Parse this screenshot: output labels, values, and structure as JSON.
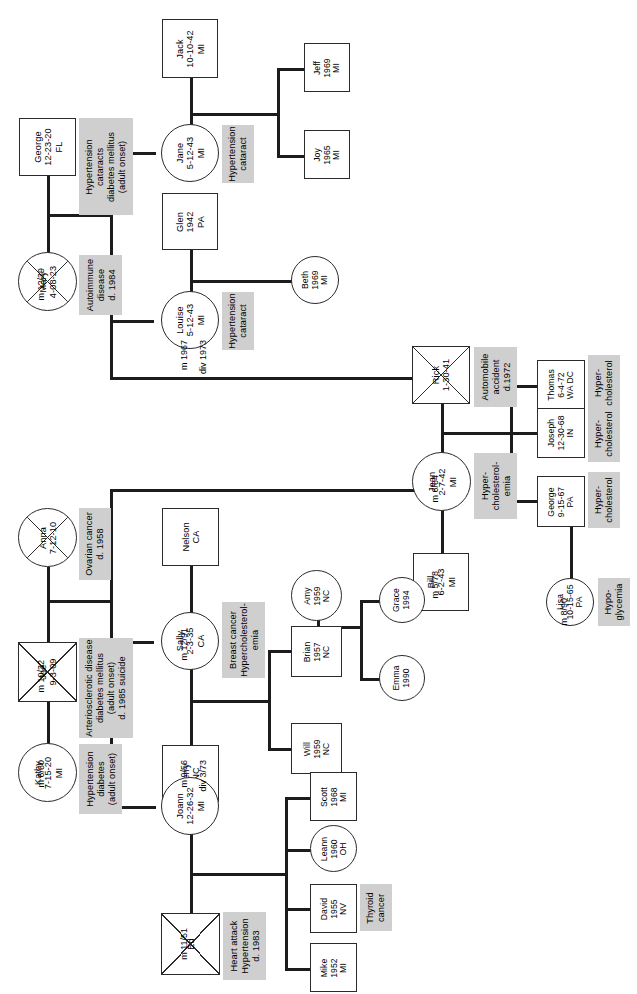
{
  "document": {
    "type": "family-pedigree-health-history-chart",
    "orientation": "rotated-90-counterclockwise",
    "symbol_legend": {
      "square": "male",
      "circle": "female",
      "diagonal-cross": "deceased",
      "grey-box": "medical condition annotation",
      "m": "married",
      "div": "divorced"
    },
    "colors": {
      "node_fill": "#ffffff",
      "node_stroke": "#2b2b2b",
      "annotation_fill": "#cfcfcf",
      "line": "#1c1c1c",
      "background": "#ffffff"
    }
  },
  "people": {
    "george_sr": {
      "name": "George",
      "dob": "12-23-20",
      "state": "FL",
      "sex": "male",
      "deceased": false,
      "text": "George\n12-23-20\nFL"
    },
    "mary": {
      "name": "Mary",
      "dob": "4-08-23",
      "state": "",
      "sex": "female",
      "deceased": true,
      "text": "Mary\n4-08-23"
    },
    "jack": {
      "name": "Jack",
      "dob": "10-10-42",
      "state": "MI",
      "sex": "male",
      "deceased": false,
      "text": "Jack\n10-10-42\nMI"
    },
    "jane": {
      "name": "Jane",
      "dob": "5-12-43",
      "state": "MI",
      "sex": "female",
      "deceased": false,
      "text": "Jane\n5-12-43\nMI"
    },
    "jeff": {
      "name": "Jeff",
      "dob": "1969",
      "state": "MI",
      "sex": "male",
      "deceased": false,
      "text": "Jeff\n1969\nMI"
    },
    "joy": {
      "name": "Joy",
      "dob": "1965",
      "state": "MI",
      "sex": "male",
      "deceased": false,
      "text": "Joy\n1965\nMI"
    },
    "glen": {
      "name": "Glen",
      "dob": "1942",
      "state": "PA",
      "sex": "male",
      "deceased": false,
      "text": "Glen\n1942\nPA"
    },
    "louise": {
      "name": "Louise",
      "dob": "5-12-43",
      "state": "MI",
      "sex": "female",
      "deceased": false,
      "text": "Louise\n5-12-43\nMI"
    },
    "beth": {
      "name": "Beth",
      "dob": "1969",
      "state": "MI",
      "sex": "female",
      "deceased": false,
      "text": "Beth\n1969\nMI"
    },
    "rick": {
      "name": "Rick",
      "dob": "1-30-41",
      "state": "",
      "sex": "male",
      "deceased": true,
      "text": "Rick\n1-30-41"
    },
    "jean": {
      "name": "Jean",
      "dob": "2-7-42",
      "state": "MI",
      "sex": "female",
      "deceased": false,
      "text": "Jean\n2-7-42\nMI"
    },
    "bill": {
      "name": "Bill",
      "dob": "6-2-43",
      "state": "MI",
      "sex": "male",
      "deceased": false,
      "text": "Bill\n6-2-43\nMI"
    },
    "thomas": {
      "name": "Thomas",
      "dob": "6-4-72",
      "state": "WA DC",
      "sex": "male",
      "deceased": false,
      "text": "Thomas\n6-4-72\nWA DC"
    },
    "joseph": {
      "name": "Joseph",
      "dob": "12-30-68",
      "state": "IN",
      "sex": "male",
      "deceased": false,
      "text": "Joseph\n12-30-68\nIN"
    },
    "george_jr": {
      "name": "George",
      "dob": "9-15-67",
      "state": "PA",
      "sex": "male",
      "deceased": false,
      "text": "George\n9-15-67\nPA"
    },
    "lisa": {
      "name": "Lisa",
      "dob": "10-15-65",
      "state": "PA",
      "sex": "female",
      "deceased": false,
      "text": "Lisa\n10-15-65\nPA"
    },
    "anna": {
      "name": "Anna",
      "dob": "7-12-10",
      "state": "",
      "sex": "female",
      "deceased": true,
      "text": "Anna\n7-12-10"
    },
    "joe": {
      "name": "Joe",
      "dob": "9-3-09",
      "state": "",
      "sex": "male",
      "deceased": true,
      "text": "Joe\n9-3-09"
    },
    "kathy": {
      "name": "Kathy",
      "dob": "7-15-20",
      "state": "MI",
      "sex": "female",
      "deceased": false,
      "text": "Kathy\n7-15-20\nMI"
    },
    "nelson": {
      "name": "Nelson",
      "dob": "",
      "state": "CA",
      "sex": "male",
      "deceased": false,
      "text": "Nelson\nCA"
    },
    "sally": {
      "name": "Sally",
      "dob": "2-3-35",
      "state": "CA",
      "sex": "female",
      "deceased": false,
      "text": "Sally\n2-3-35\nCA"
    },
    "jerry": {
      "name": "Jerry",
      "dob": "",
      "state": "NC",
      "sex": "male",
      "deceased": false,
      "text": "Jerry\nNC"
    },
    "amy": {
      "name": "Amy",
      "dob": "1959",
      "state": "NC",
      "sex": "female",
      "deceased": false,
      "text": "Amy\n1959\nNC"
    },
    "brian": {
      "name": "Brian",
      "dob": "1957",
      "state": "NC",
      "sex": "male",
      "deceased": false,
      "text": "Brian\n1957\nNC"
    },
    "will": {
      "name": "Will",
      "dob": "1959",
      "state": "NC",
      "sex": "male",
      "deceased": false,
      "text": "Will\n1959\nNC"
    },
    "grace": {
      "name": "Grace",
      "dob": "1994",
      "state": "",
      "sex": "female",
      "deceased": false,
      "text": "Grace\n1994"
    },
    "emma": {
      "name": "Emma",
      "dob": "1990",
      "state": "",
      "sex": "female",
      "deceased": false,
      "text": "Emma\n1990"
    },
    "joann": {
      "name": "Joann",
      "dob": "12-26-32",
      "state": "MI",
      "sex": "female",
      "deceased": false,
      "text": "Joann\n12-26-32\nMI"
    },
    "ed": {
      "name": "Ed",
      "dob": "",
      "state": "",
      "sex": "male",
      "deceased": true,
      "text": "Ed"
    },
    "scott": {
      "name": "Scott",
      "dob": "1968",
      "state": "MI",
      "sex": "male",
      "deceased": false,
      "text": "Scott\n1968\nMI"
    },
    "leann": {
      "name": "Leann",
      "dob": "1960",
      "state": "OH",
      "sex": "female",
      "deceased": false,
      "text": "Leann\n1960\nOH"
    },
    "david": {
      "name": "David",
      "dob": "1955",
      "state": "NV",
      "sex": "male",
      "deceased": false,
      "text": "David\n1955\nNV"
    },
    "mike": {
      "name": "Mike",
      "dob": "1952",
      "state": "MI",
      "sex": "male",
      "deceased": false,
      "text": "Mike\n1952\nMI"
    }
  },
  "annotations": {
    "george_sr_cond": "Hypertension\ncataracts\ndiabetes mellitus\n(adult onset)",
    "mary_cond": "Autoimmune\ndisease\nd. 1984",
    "jane_cond": "Hypertension\ncataract",
    "louise_cond": "Hypertension\ncataract",
    "rick_cond": "Automobile\naccident\nd.1972",
    "jean_cond": "Hyper-\ncholesterol-\nemia",
    "thomas_cond": "Hyper-\ncholesterol",
    "joseph_cond": "Hyper-\ncholesterol",
    "george_jr_cond": "Hyper-\ncholesterol",
    "lisa_cond": "Hypo-\nglycemia",
    "anna_cond": "Ovarian cancer\nd. 1958",
    "joe_cond": "Arteriosclerotic disease\ndiabetes mellitus\n(adult onset)\nd. 1985 suicide",
    "kathy_cond": "Hypertension\ndiabetes\n(adult onset)",
    "sally_cond": "Breast cancer\nHypercholesterol-\nemia",
    "ed_cond": "Heart attack\nHypertension\nd. 1983",
    "david_cond": "Thyroid\ncancer"
  },
  "unions": {
    "george_mary": {
      "married": "m 12/39",
      "divorced": ""
    },
    "jack_jane": {
      "married": "",
      "divorced": ""
    },
    "glen_louise": {
      "married": "m 1967",
      "divorced": "div 1973"
    },
    "rick_jean": {
      "married": "m 6/64",
      "divorced": ""
    },
    "jean_bill": {
      "married": "m 5/78",
      "divorced": ""
    },
    "georgejr_lisa": {
      "married": "m 8/90",
      "divorced": ""
    },
    "joe_anna": {
      "married": "m 10/32",
      "divorced": ""
    },
    "joe_kathy": {
      "married": "m 6/60",
      "divorced": ""
    },
    "sally_nelson": {
      "married": "m 12/91",
      "divorced": ""
    },
    "sally_jerry": {
      "married": "m 9/56",
      "divorced": "div 3/73"
    },
    "joann_ed": {
      "married": "m 11/51",
      "divorced": ""
    }
  }
}
